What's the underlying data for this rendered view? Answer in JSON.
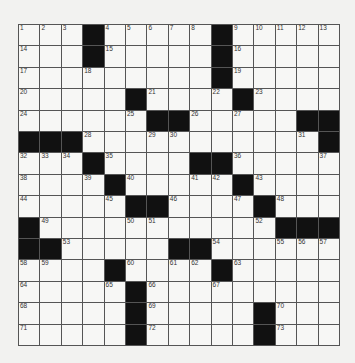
{
  "puzzle": {
    "size": {
      "rows": 15,
      "cols": 15
    },
    "layout": [
      "...#.....#.....",
      "...#.....#.....",
      ".........#.....",
      ".....#...#.....",
      "......##....##",
      "###..........#",
      "...#....##.....",
      "....#.....#....",
      ".....##....#...",
      "#..........####",
      "##.....##......",
      "....#....#.....",
      ".....#.........",
      ".....#.....#...",
      ".....#.....#..."
    ],
    "numbers": [
      [
        1,
        2,
        3,
        0,
        4,
        5,
        6,
        7,
        8,
        0,
        9,
        10,
        11,
        12,
        13
      ],
      [
        14,
        0,
        0,
        0,
        15,
        0,
        0,
        0,
        0,
        0,
        16,
        0,
        0,
        0,
        0
      ],
      [
        17,
        0,
        0,
        18,
        0,
        0,
        0,
        0,
        0,
        0,
        19,
        0,
        0,
        0,
        0
      ],
      [
        20,
        0,
        0,
        0,
        0,
        0,
        21,
        0,
        0,
        22,
        0,
        23,
        0,
        0,
        0
      ],
      [
        24,
        0,
        0,
        0,
        0,
        25,
        0,
        0,
        26,
        0,
        27,
        0,
        0,
        0,
        0
      ],
      [
        0,
        0,
        0,
        28,
        0,
        0,
        29,
        30,
        0,
        0,
        0,
        0,
        0,
        31,
        0
      ],
      [
        32,
        33,
        34,
        0,
        35,
        0,
        0,
        0,
        0,
        0,
        36,
        0,
        0,
        0,
        37
      ],
      [
        38,
        0,
        0,
        39,
        0,
        40,
        0,
        0,
        41,
        42,
        0,
        43,
        0,
        0,
        0
      ],
      [
        44,
        0,
        0,
        0,
        45,
        0,
        0,
        46,
        0,
        0,
        47,
        0,
        48,
        0,
        0
      ],
      [
        0,
        49,
        0,
        0,
        0,
        50,
        51,
        0,
        0,
        0,
        0,
        52,
        0,
        0,
        0
      ],
      [
        0,
        0,
        53,
        0,
        0,
        0,
        0,
        0,
        0,
        54,
        0,
        0,
        55,
        56,
        57
      ],
      [
        58,
        59,
        0,
        0,
        0,
        60,
        0,
        61,
        62,
        0,
        63,
        0,
        0,
        0,
        0
      ],
      [
        64,
        0,
        0,
        0,
        65,
        0,
        66,
        0,
        0,
        67,
        0,
        0,
        0,
        0,
        0
      ],
      [
        68,
        0,
        0,
        0,
        0,
        0,
        69,
        0,
        0,
        0,
        0,
        0,
        70,
        0,
        0
      ],
      [
        71,
        0,
        0,
        0,
        0,
        0,
        72,
        0,
        0,
        0,
        0,
        0,
        73,
        0,
        0
      ]
    ],
    "colors": {
      "black": "#111111",
      "white": "#f7f7f5",
      "line": "#555555"
    }
  }
}
